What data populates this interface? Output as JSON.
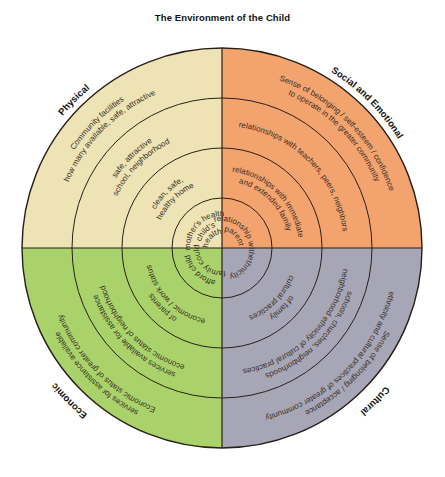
{
  "title": "The Environment of the Child",
  "geometry": {
    "cx": 222,
    "cy": 248,
    "radii": [
      200,
      150,
      100,
      50
    ],
    "label_radius": 207
  },
  "colors": {
    "physical": "#ede3b4",
    "social_emotional": "#f2a36e",
    "economic": "#a9d36a",
    "cultural": "#a7a6b6",
    "line": "#2a1f18",
    "text": "#3a2e25"
  },
  "quadrants": [
    {
      "id": "physical",
      "label": "Physical",
      "angle": -45,
      "rings": [
        {
          "ring": 4,
          "lines": [
            "Community facilities",
            "how many available, safe, attractive"
          ]
        },
        {
          "ring": 3,
          "lines": [
            "safe, attractive",
            "school, neighborhood"
          ]
        },
        {
          "ring": 2,
          "lines": [
            "clean, safe,",
            "healthy home"
          ]
        },
        {
          "ring": 1,
          "lines": [
            "mother's health",
            "child's",
            "health"
          ]
        }
      ]
    },
    {
      "id": "social_emotional",
      "label": "Social and Emotional",
      "angle": 45,
      "rings": [
        {
          "ring": 4,
          "lines": [
            "Sense of belonging / self-esteem / confidence",
            "to operate in the greater community"
          ]
        },
        {
          "ring": 3,
          "lines": [
            "relationships with teachers, peers, neighbors"
          ]
        },
        {
          "ring": 2,
          "lines": [
            "relationships with immediate",
            "and extended family"
          ]
        },
        {
          "ring": 1,
          "lines": [
            "relationship with",
            "parent"
          ]
        }
      ]
    },
    {
      "id": "cultural",
      "label": "Cultural",
      "angle": 135,
      "rings": [
        {
          "ring": 4,
          "lines": [
            "ethnicity and cultural practices of greater community",
            "Sense of belonging / acceptance"
          ]
        },
        {
          "ring": 3,
          "lines": [
            "neighborhood ethnicity of cultural practices",
            "schools, churches, neighborhoods"
          ]
        },
        {
          "ring": 2,
          "lines": [
            "cultural practices",
            "of family"
          ]
        },
        {
          "ring": 1,
          "lines": [
            "ethnicity"
          ]
        }
      ]
    },
    {
      "id": "economic",
      "label": "Economic",
      "angle": -135,
      "rings": [
        {
          "ring": 4,
          "lines": [
            "Economic status of greater community",
            "services for assistance available"
          ]
        },
        {
          "ring": 3,
          "lines": [
            "economic status of neighborhood",
            "services available for assistance"
          ]
        },
        {
          "ring": 2,
          "lines": [
            "economic / work status",
            "of parents"
          ]
        },
        {
          "ring": 1,
          "lines": [
            "family could",
            "afford child"
          ]
        }
      ]
    }
  ]
}
